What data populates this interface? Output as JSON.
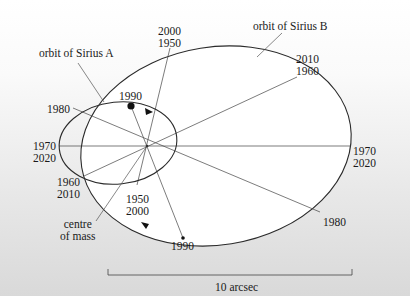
{
  "diagram": {
    "labels": {
      "orbit_a": "orbit of Sirius A",
      "orbit_b": "orbit of Sirius B",
      "centre_line1": "centre",
      "centre_line2": "of mass",
      "scale": "10 arcsec"
    },
    "sirius_b_dates": {
      "top": [
        "2000",
        "1950"
      ],
      "upper_right": [
        "2010",
        "1960"
      ],
      "right": [
        "1970",
        "2020"
      ],
      "lower_right": [
        "1980"
      ],
      "bottom": [
        "1990"
      ]
    },
    "sirius_a_dates": {
      "top": [
        "1990"
      ],
      "upper_left": [
        "1980"
      ],
      "left": [
        "1970",
        "2020"
      ],
      "lower_left": [
        "1960",
        "2010"
      ],
      "bottom": [
        "1950",
        "2000"
      ]
    },
    "colors": {
      "line": "#333333",
      "orbit": "#2a2a2a",
      "bg_top": "#ffffff",
      "bg_bottom": "#d9d9d9"
    }
  }
}
